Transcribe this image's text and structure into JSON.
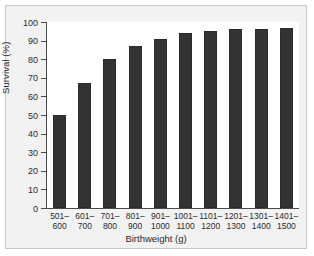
{
  "figure": {
    "background_color": "#f2f2f2",
    "plot_background_color": "#ffffff",
    "bar_color": "#333333",
    "axis_color": "#4a4a4a"
  },
  "chart_data": {
    "type": "bar",
    "title": "",
    "xlabel": "Birthweight (g)",
    "ylabel": "Survival (%)",
    "categories": [
      "501–\n600",
      "601–\n700",
      "701–\n800",
      "801–\n900",
      "901–\n1000",
      "1001–\n1100",
      "1101–\n1200",
      "1201–\n1300",
      "1301–\n1400",
      "1401–\n1500"
    ],
    "category_lines": [
      [
        "501–",
        "600"
      ],
      [
        "601–",
        "700"
      ],
      [
        "701–",
        "800"
      ],
      [
        "801–",
        "900"
      ],
      [
        "901–",
        "1000"
      ],
      [
        "1001–",
        "1100"
      ],
      [
        "1101–",
        "1200"
      ],
      [
        "1201–",
        "1300"
      ],
      [
        "1301–",
        "1400"
      ],
      [
        "1401–",
        "1500"
      ]
    ],
    "values": [
      50,
      67,
      80,
      87,
      91,
      94,
      95,
      96,
      96,
      97
    ],
    "ylim": [
      0,
      100
    ],
    "yticks": [
      0,
      10,
      20,
      30,
      40,
      50,
      60,
      70,
      80,
      90,
      100
    ],
    "ytick_labels": [
      "0",
      "10",
      "20",
      "30",
      "40",
      "50",
      "60",
      "70",
      "80",
      "90",
      "100"
    ],
    "grid": false,
    "legend": null
  }
}
